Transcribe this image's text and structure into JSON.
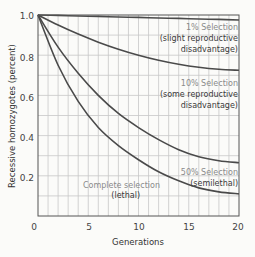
{
  "chart_data": {
    "type": "line",
    "title": "",
    "xlabel": "Generations",
    "ylabel": "Recessive homozygotes (percent)",
    "xlim": [
      0,
      20
    ],
    "ylim": [
      0,
      1.0
    ],
    "grid": true,
    "x_ticks": [
      "0",
      "5",
      "10",
      "15",
      "20"
    ],
    "y_ticks": [
      "0.2",
      "0.4",
      "0.6",
      "0.8",
      "1.0"
    ],
    "x": [
      0,
      2,
      4,
      6,
      8,
      10,
      12,
      14,
      16,
      18,
      20
    ],
    "series": [
      {
        "name": "1% Selection",
        "note": "(slight reproductive disadvantage)",
        "values": [
          1.0,
          0.998,
          0.995,
          0.993,
          0.99,
          0.988,
          0.985,
          0.983,
          0.98,
          0.978,
          0.975
        ]
      },
      {
        "name": "10% Selection",
        "note": "(some reproductive disadvantage)",
        "values": [
          1.0,
          0.95,
          0.905,
          0.865,
          0.83,
          0.8,
          0.775,
          0.755,
          0.74,
          0.73,
          0.725
        ]
      },
      {
        "name": "50% Selection",
        "note": "(semilethal)",
        "values": [
          1.0,
          0.84,
          0.71,
          0.6,
          0.51,
          0.44,
          0.38,
          0.33,
          0.295,
          0.275,
          0.265
        ]
      },
      {
        "name": "Complete selection",
        "note": "(lethal)",
        "values": [
          1.0,
          0.75,
          0.57,
          0.44,
          0.35,
          0.28,
          0.22,
          0.175,
          0.14,
          0.12,
          0.11
        ]
      }
    ],
    "annotations": [
      {
        "line1": "1% Selection",
        "line2": "(slight reproductive",
        "line3": "disadvantage)"
      },
      {
        "line1": "10% Selection",
        "line2": "(some reproductive",
        "line3": "disadvantage)"
      },
      {
        "line1": "50% Selection",
        "line2": "(semilethal)"
      },
      {
        "line1": "Complete selection",
        "line2": "(lethal)"
      }
    ],
    "line_color": "#4a4a4a",
    "grid_color": "#c8c8c8"
  }
}
